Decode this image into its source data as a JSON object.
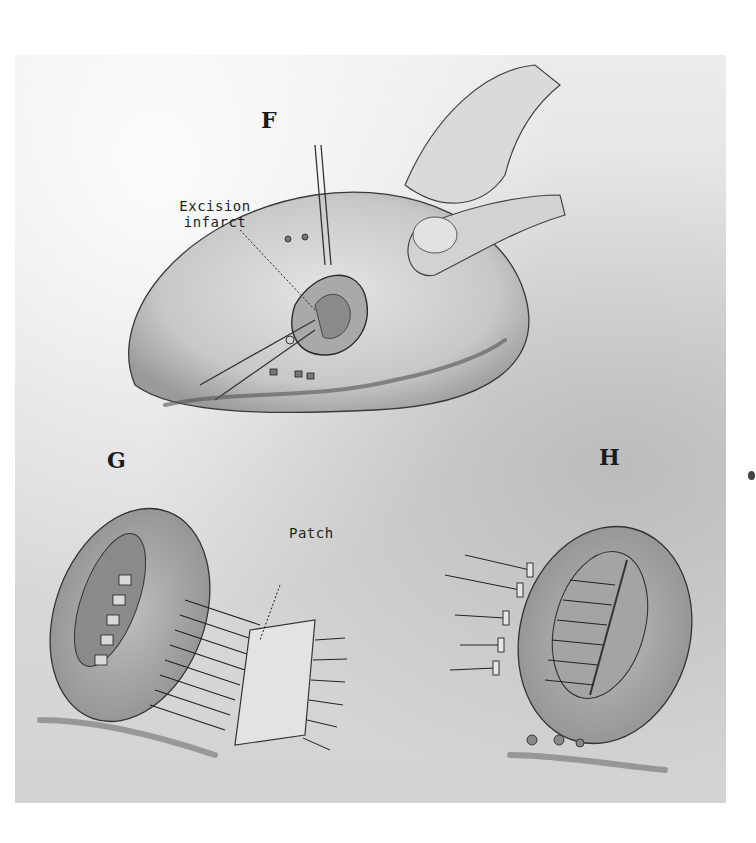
{
  "figure": {
    "panels": [
      {
        "id": "F",
        "label": "F",
        "callouts": [
          {
            "text_line1": "Excision",
            "text_line2": "infarct"
          }
        ]
      },
      {
        "id": "G",
        "label": "G",
        "callouts": [
          {
            "text": "Patch"
          }
        ]
      },
      {
        "id": "H",
        "label": "H",
        "callouts": []
      }
    ],
    "colors": {
      "background": "#ffffff",
      "paper": "#e0e0e0",
      "ink": "#1a1a1a",
      "tissue": "#c9c9c9"
    }
  }
}
